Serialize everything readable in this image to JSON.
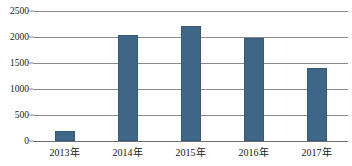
{
  "chart_data": {
    "type": "bar",
    "title": "",
    "subtitle": "",
    "xlabel": "",
    "ylabel": "",
    "categories": [
      "2013年",
      "2014年",
      "2015年",
      "2016年",
      "2017年"
    ],
    "values": [
      190,
      2040,
      2210,
      1980,
      1400
    ],
    "ylim": [
      0,
      2500
    ],
    "ytick_labels": [
      "0",
      "500",
      "1000",
      "1500",
      "2000",
      "2500"
    ],
    "ytick_values": [
      0,
      500,
      1000,
      1500,
      2000,
      2500
    ],
    "grid": true,
    "legend": false,
    "legend_position": "none",
    "series": [
      {
        "name": "",
        "values": [
          190,
          2040,
          2210,
          1980,
          1400
        ]
      }
    ],
    "colors": {
      "bar": "#3d6687",
      "bar_border": "#35597a",
      "gridline": "#8a8a8a",
      "axis": "#6e6e6e",
      "text": "#181818",
      "background": "#ffffff"
    }
  }
}
